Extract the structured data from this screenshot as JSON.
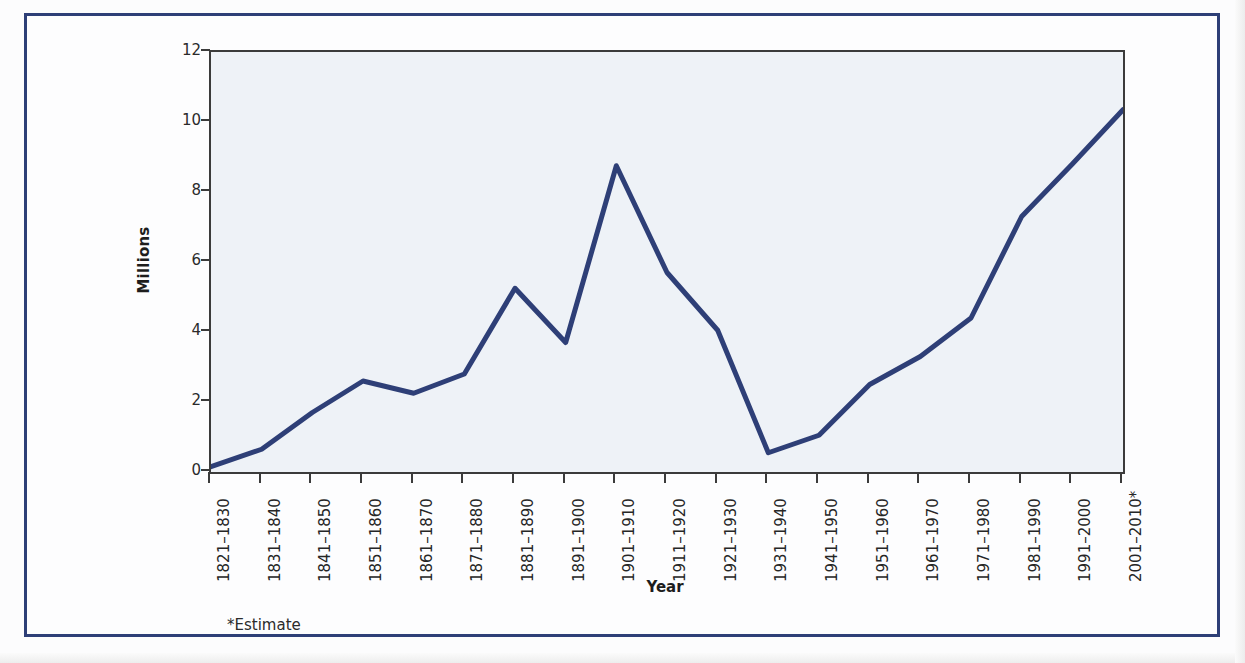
{
  "chart_data": {
    "type": "line",
    "title": "",
    "xlabel": "Year",
    "ylabel": "Millions",
    "ylim": [
      0,
      12
    ],
    "yticks": [
      0,
      2,
      4,
      6,
      8,
      10,
      12
    ],
    "grid": false,
    "legend": null,
    "footnote": "*Estimate",
    "line_color": "#2e3f77",
    "plot_background": "#eef2f7",
    "categories": [
      "1821–1830",
      "1831–1840",
      "1841–1850",
      "1851–1860",
      "1861–1870",
      "1871–1880",
      "1881–1890",
      "1891–1900",
      "1901–1910",
      "1911–1920",
      "1921–1930",
      "1931–1940",
      "1941–1950",
      "1951–1960",
      "1961–1970",
      "1971–1980",
      "1981–1990",
      "1991–2000",
      "2001–2010*"
    ],
    "values": [
      0.15,
      0.65,
      1.7,
      2.6,
      2.25,
      2.8,
      5.25,
      3.7,
      8.75,
      5.7,
      4.05,
      0.55,
      1.05,
      2.5,
      3.3,
      4.4,
      7.3,
      8.8,
      10.35
    ],
    "series": [
      {
        "name": "Immigration",
        "values": [
          0.15,
          0.65,
          1.7,
          2.6,
          2.25,
          2.8,
          5.25,
          3.7,
          8.75,
          5.7,
          4.05,
          0.55,
          1.05,
          2.5,
          3.3,
          4.4,
          7.3,
          8.8,
          10.35
        ]
      }
    ]
  }
}
